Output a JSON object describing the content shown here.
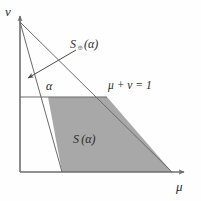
{
  "figure": {
    "background_color": "#fefefe",
    "line_color": "#4a4a4a",
    "axis_color": "#6e6e6e",
    "shade_color": "#a8a8a8",
    "text_color": "#2b2b2b"
  },
  "axes": {
    "y_label": "ν",
    "x_label": "μ",
    "origin": {
      "x": 20,
      "y": 172
    },
    "y_axis_top": 14,
    "x_axis_right": 186
  },
  "labels": {
    "set_outer_name": "S",
    "set_outer_subscript": "⊕",
    "set_outer_arg": "(α)",
    "set_outer_full": "S⊕(α)",
    "set_inner_name": "S",
    "set_inner_subscript": "",
    "set_inner_arg": "(α)",
    "set_inner_full": "S(α)",
    "constraint": "μ + ν = 1",
    "alpha": "α"
  },
  "geometry": {
    "apex": {
      "x": 20,
      "y": 22
    },
    "constraint_line_end": {
      "x": 172,
      "y": 172
    },
    "inner_line_end": {
      "x": 62,
      "y": 172
    },
    "alpha_line_y": 97,
    "alpha_line_x_start": 20,
    "alpha_line_x_end": 107,
    "shaded_polygon": [
      {
        "x": 48,
        "y": 97
      },
      {
        "x": 107,
        "y": 97
      },
      {
        "x": 172,
        "y": 172
      },
      {
        "x": 62,
        "y": 172
      }
    ],
    "leader_arrow": {
      "from": {
        "x": 72,
        "y": 52
      },
      "to": {
        "x": 27,
        "y": 79
      }
    }
  }
}
